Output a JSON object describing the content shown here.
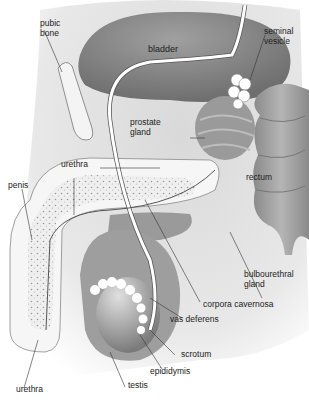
{
  "diagram": {
    "colors": {
      "background_shade": "#e6e6e6",
      "bladder": "#8c8c8c",
      "organ_mid": "#a6a6a6",
      "organ_light": "#cfcfcf",
      "tube": "#ffffff",
      "outline": "#444444",
      "label_text": "#222222"
    },
    "labels": [
      {
        "id": "pubic-bone",
        "text": "pubic\nbone"
      },
      {
        "id": "bladder",
        "text": "bladder"
      },
      {
        "id": "seminal-vesicle",
        "text": "seminal\nvesicle"
      },
      {
        "id": "prostate-gland",
        "text": "prostate\ngland"
      },
      {
        "id": "urethra-upper",
        "text": "urethra"
      },
      {
        "id": "rectum",
        "text": "rectum"
      },
      {
        "id": "penis",
        "text": "penis"
      },
      {
        "id": "bulbourethral-gland",
        "text": "bulbourethral\ngland"
      },
      {
        "id": "corpora-cavernosa",
        "text": "corpora cavernosa"
      },
      {
        "id": "vas-deferens",
        "text": "vas deferens"
      },
      {
        "id": "scrotum",
        "text": "scrotum"
      },
      {
        "id": "epididymis",
        "text": "epididymis"
      },
      {
        "id": "testis",
        "text": "testis"
      },
      {
        "id": "urethra-lower",
        "text": "urethra"
      }
    ]
  }
}
